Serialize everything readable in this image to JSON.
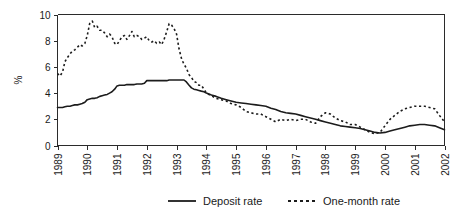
{
  "chart_data": {
    "type": "line",
    "title": "",
    "xlabel": "",
    "ylabel": "%",
    "xlim": [
      1989,
      2002
    ],
    "ylim": [
      0,
      10
    ],
    "grid": false,
    "legend_position": "bottom",
    "xticks": [
      "1989",
      "1990",
      "1991",
      "1992",
      "1993",
      "1994",
      "1995",
      "1996",
      "1997",
      "1998",
      "1999",
      "2000",
      "2001",
      "2002"
    ],
    "yticks": [
      "0",
      "2",
      "4",
      "6",
      "8",
      "10"
    ],
    "series": [
      {
        "name": "Deposit rate",
        "style": "solid",
        "color": "#1c1c1c",
        "x": [
          1989.0,
          1989.08,
          1989.17,
          1989.25,
          1989.33,
          1989.42,
          1989.5,
          1989.58,
          1989.67,
          1989.75,
          1989.83,
          1989.92,
          1990.0,
          1990.08,
          1990.17,
          1990.25,
          1990.33,
          1990.42,
          1990.5,
          1990.58,
          1990.67,
          1990.75,
          1990.83,
          1990.92,
          1991.0,
          1991.08,
          1991.17,
          1991.25,
          1991.33,
          1991.42,
          1991.5,
          1991.58,
          1991.67,
          1991.75,
          1991.83,
          1991.92,
          1992.0,
          1992.08,
          1992.17,
          1992.25,
          1992.33,
          1992.42,
          1992.5,
          1992.58,
          1992.67,
          1992.75,
          1992.83,
          1992.92,
          1993.0,
          1993.08,
          1993.17,
          1993.25,
          1993.33,
          1993.42,
          1993.5,
          1993.58,
          1993.67,
          1993.75,
          1993.83,
          1993.92,
          1994.0,
          1994.17,
          1994.33,
          1994.5,
          1994.67,
          1994.83,
          1995.0,
          1995.17,
          1995.33,
          1995.5,
          1995.67,
          1995.83,
          1996.0,
          1996.17,
          1996.33,
          1996.5,
          1996.67,
          1996.83,
          1997.0,
          1997.17,
          1997.33,
          1997.5,
          1997.67,
          1997.83,
          1998.0,
          1998.17,
          1998.33,
          1998.5,
          1998.67,
          1998.83,
          1999.0,
          1999.17,
          1999.33,
          1999.5,
          1999.67,
          1999.83,
          2000.0,
          2000.17,
          2000.33,
          2000.5,
          2000.67,
          2000.83,
          2001.0,
          2001.17,
          2001.33,
          2001.5,
          2001.67,
          2001.83,
          2002.0
        ],
        "y": [
          2.9,
          2.9,
          2.9,
          2.95,
          3.0,
          3.0,
          3.05,
          3.1,
          3.1,
          3.15,
          3.2,
          3.3,
          3.5,
          3.55,
          3.6,
          3.6,
          3.65,
          3.75,
          3.8,
          3.85,
          3.9,
          4.0,
          4.1,
          4.3,
          4.55,
          4.6,
          4.6,
          4.6,
          4.65,
          4.65,
          4.65,
          4.65,
          4.7,
          4.7,
          4.7,
          4.75,
          4.95,
          4.95,
          4.95,
          4.95,
          4.95,
          4.95,
          4.95,
          4.95,
          4.95,
          5.0,
          5.0,
          5.0,
          5.0,
          5.0,
          5.0,
          5.0,
          4.85,
          4.6,
          4.4,
          4.3,
          4.25,
          4.2,
          4.15,
          4.1,
          4.0,
          3.85,
          3.75,
          3.6,
          3.5,
          3.4,
          3.3,
          3.25,
          3.2,
          3.15,
          3.1,
          3.05,
          3.0,
          2.85,
          2.75,
          2.6,
          2.5,
          2.45,
          2.4,
          2.3,
          2.2,
          2.1,
          2.0,
          1.9,
          1.8,
          1.7,
          1.6,
          1.5,
          1.45,
          1.4,
          1.35,
          1.3,
          1.2,
          1.1,
          1.0,
          0.95,
          1.0,
          1.1,
          1.2,
          1.3,
          1.4,
          1.5,
          1.55,
          1.6,
          1.6,
          1.55,
          1.5,
          1.35,
          1.2
        ]
      },
      {
        "name": "One-month rate",
        "style": "dashed",
        "color": "#1c1c1c",
        "x": [
          1989.0,
          1989.08,
          1989.17,
          1989.25,
          1989.33,
          1989.42,
          1989.5,
          1989.58,
          1989.67,
          1989.75,
          1989.83,
          1989.92,
          1990.0,
          1990.08,
          1990.17,
          1990.25,
          1990.33,
          1990.42,
          1990.5,
          1990.58,
          1990.67,
          1990.75,
          1990.83,
          1990.92,
          1991.0,
          1991.08,
          1991.17,
          1991.25,
          1991.33,
          1991.42,
          1991.5,
          1991.58,
          1991.67,
          1991.75,
          1991.83,
          1991.92,
          1992.0,
          1992.08,
          1992.17,
          1992.25,
          1992.33,
          1992.42,
          1992.5,
          1992.58,
          1992.67,
          1992.75,
          1992.83,
          1992.92,
          1993.0,
          1993.08,
          1993.17,
          1993.25,
          1993.33,
          1993.42,
          1993.5,
          1993.58,
          1993.67,
          1993.75,
          1993.83,
          1993.92,
          1994.0,
          1994.17,
          1994.33,
          1994.5,
          1994.67,
          1994.83,
          1995.0,
          1995.17,
          1995.33,
          1995.5,
          1995.67,
          1995.83,
          1996.0,
          1996.17,
          1996.33,
          1996.5,
          1996.67,
          1996.83,
          1997.0,
          1997.17,
          1997.33,
          1997.5,
          1997.67,
          1997.83,
          1998.0,
          1998.17,
          1998.33,
          1998.5,
          1998.67,
          1998.83,
          1999.0,
          1999.17,
          1999.33,
          1999.5,
          1999.67,
          1999.83,
          2000.0,
          2000.17,
          2000.33,
          2000.5,
          2000.67,
          2000.83,
          2001.0,
          2001.17,
          2001.33,
          2001.5,
          2001.67,
          2001.83,
          2002.0
        ],
        "y": [
          5.5,
          5.3,
          5.6,
          6.4,
          6.7,
          7.0,
          7.2,
          7.3,
          7.5,
          7.7,
          7.6,
          7.8,
          8.4,
          9.3,
          9.5,
          9.0,
          9.1,
          8.8,
          8.8,
          8.6,
          8.3,
          8.5,
          8.3,
          7.8,
          7.7,
          8.0,
          8.3,
          8.4,
          8.1,
          8.4,
          8.7,
          8.3,
          8.4,
          8.3,
          8.1,
          8.2,
          8.3,
          8.0,
          7.9,
          8.0,
          7.8,
          7.9,
          7.7,
          8.1,
          8.7,
          9.3,
          9.2,
          8.9,
          8.5,
          7.4,
          6.6,
          6.2,
          5.9,
          5.4,
          5.2,
          4.9,
          4.8,
          4.6,
          4.6,
          4.3,
          4.0,
          3.8,
          3.6,
          3.5,
          3.4,
          3.2,
          3.1,
          2.9,
          2.6,
          2.5,
          2.4,
          2.4,
          2.2,
          2.0,
          1.8,
          2.0,
          1.9,
          2.0,
          1.9,
          2.0,
          2.0,
          1.8,
          1.7,
          2.2,
          2.5,
          2.4,
          2.1,
          1.9,
          1.8,
          1.6,
          1.6,
          1.4,
          1.2,
          1.0,
          0.9,
          1.0,
          1.5,
          2.0,
          2.3,
          2.6,
          2.8,
          2.9,
          3.0,
          3.0,
          3.0,
          2.9,
          2.8,
          2.3,
          1.8
        ]
      }
    ],
    "legend": [
      {
        "label": "Deposit rate",
        "style": "solid"
      },
      {
        "label": "One-month rate",
        "style": "dashed"
      }
    ]
  }
}
